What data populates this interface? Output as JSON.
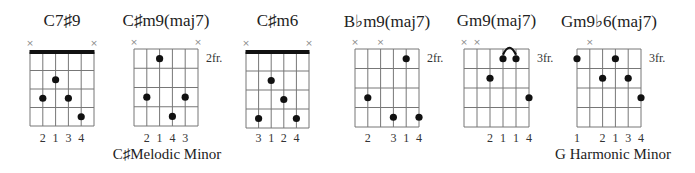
{
  "colors": {
    "line": "#777777",
    "nut": "#111111",
    "dot": "#111111",
    "text": "#222222"
  },
  "chords": [
    {
      "name": "C7♯9",
      "fret_label": "",
      "nut": true,
      "muted_strings": [
        6,
        1
      ],
      "dots": [
        {
          "string": 5,
          "fret": 3
        },
        {
          "string": 4,
          "fret": 2
        },
        {
          "string": 3,
          "fret": 3
        },
        {
          "string": 2,
          "fret": 4
        }
      ],
      "barre": null,
      "fingers": [
        {
          "string": 5,
          "label": "2"
        },
        {
          "string": 4,
          "label": "1"
        },
        {
          "string": 3,
          "label": "3"
        },
        {
          "string": 2,
          "label": "4"
        }
      ],
      "geom": {
        "left": 30,
        "top": 52,
        "width": 64,
        "height": 74
      }
    },
    {
      "name": "C♯m9(maj7)",
      "fret_label": "2fr.",
      "nut": false,
      "muted_strings": [
        6,
        1
      ],
      "dots": [
        {
          "string": 5,
          "fret": 3
        },
        {
          "string": 4,
          "fret": 1
        },
        {
          "string": 3,
          "fret": 4
        },
        {
          "string": 2,
          "fret": 3
        }
      ],
      "barre": null,
      "fingers": [
        {
          "string": 5,
          "label": "2"
        },
        {
          "string": 4,
          "label": "1"
        },
        {
          "string": 3,
          "label": "4"
        },
        {
          "string": 2,
          "label": "3"
        }
      ],
      "geom": {
        "left": 134,
        "top": 49,
        "width": 64,
        "height": 77
      }
    },
    {
      "name": "C♯m6",
      "fret_label": "",
      "nut": true,
      "muted_strings": [
        6,
        1
      ],
      "dots": [
        {
          "string": 5,
          "fret": 4
        },
        {
          "string": 4,
          "fret": 2
        },
        {
          "string": 3,
          "fret": 3
        },
        {
          "string": 2,
          "fret": 4
        }
      ],
      "barre": null,
      "fingers": [
        {
          "string": 5,
          "label": "3"
        },
        {
          "string": 4,
          "label": "1"
        },
        {
          "string": 3,
          "label": "2"
        },
        {
          "string": 2,
          "label": "4"
        }
      ],
      "geom": {
        "left": 246,
        "top": 52,
        "width": 63,
        "height": 76
      }
    },
    {
      "name": "B♭m9(maj7)",
      "fret_label": "2fr.",
      "nut": false,
      "muted_strings": [
        6,
        4
      ],
      "dots": [
        {
          "string": 5,
          "fret": 3
        },
        {
          "string": 3,
          "fret": 4
        },
        {
          "string": 2,
          "fret": 1
        },
        {
          "string": 1,
          "fret": 4
        }
      ],
      "barre": null,
      "fingers": [
        {
          "string": 5,
          "label": "2"
        },
        {
          "string": 3,
          "label": "3"
        },
        {
          "string": 2,
          "label": "1"
        },
        {
          "string": 1,
          "label": "4"
        }
      ],
      "geom": {
        "left": 355,
        "top": 49,
        "width": 64,
        "height": 78
      }
    },
    {
      "name": "Gm9(maj7)",
      "fret_label": "3fr.",
      "nut": false,
      "muted_strings": [
        6,
        5
      ],
      "dots": [
        {
          "string": 4,
          "fret": 2
        },
        {
          "string": 3,
          "fret": 1
        },
        {
          "string": 2,
          "fret": 1
        },
        {
          "string": 1,
          "fret": 3
        }
      ],
      "barre": {
        "from_string": 3,
        "to_string": 2,
        "fret": 1
      },
      "fingers": [
        {
          "string": 4,
          "label": "2"
        },
        {
          "string": 3,
          "label": "1"
        },
        {
          "string": 2,
          "label": "1"
        },
        {
          "string": 1,
          "label": "4"
        }
      ],
      "geom": {
        "left": 464,
        "top": 49,
        "width": 65,
        "height": 78
      }
    },
    {
      "name": "Gm9♭6(maj7)",
      "fret_label": "3fr.",
      "nut": false,
      "muted_strings": [
        5
      ],
      "dots": [
        {
          "string": 6,
          "fret": 1
        },
        {
          "string": 4,
          "fret": 2
        },
        {
          "string": 3,
          "fret": 1
        },
        {
          "string": 2,
          "fret": 2
        },
        {
          "string": 1,
          "fret": 3
        }
      ],
      "barre": null,
      "fingers": [
        {
          "string": 6,
          "label": "1"
        },
        {
          "string": 4,
          "label": "2"
        },
        {
          "string": 3,
          "label": "1"
        },
        {
          "string": 2,
          "label": "3"
        },
        {
          "string": 1,
          "label": "4"
        }
      ],
      "geom": {
        "left": 577,
        "top": 49,
        "width": 64,
        "height": 78
      }
    }
  ],
  "scale_labels": [
    {
      "text": "C♯Melodic Minor",
      "center_x": 167
    },
    {
      "text": "G Harmonic Minor",
      "center_x": 613
    }
  ]
}
